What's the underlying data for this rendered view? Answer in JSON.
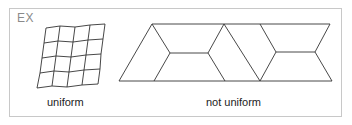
{
  "label": "EX",
  "figures": [
    {
      "caption": "uniform"
    },
    {
      "caption": "not uniform"
    }
  ],
  "colors": {
    "line": "#333333",
    "border": "#c8c8c8",
    "label": "#8a8a8a"
  }
}
